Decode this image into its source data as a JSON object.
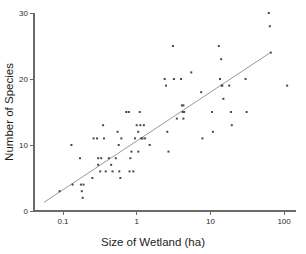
{
  "chart_data": {
    "type": "scatter",
    "title": "",
    "xlabel": "Size of Wetland (ha)",
    "ylabel": "Number of Species",
    "xscale": "log",
    "yscale": "linear",
    "xlim": [
      0.045,
      160
    ],
    "ylim": [
      0,
      31
    ],
    "grid": false,
    "legend": "none",
    "xticks": [
      0.1,
      1,
      10,
      100
    ],
    "xtick_labels": [
      "0.1",
      "1",
      "10",
      "100"
    ],
    "yticks": [
      0,
      10,
      20,
      30
    ],
    "ytick_labels": [
      "0",
      "10",
      "20",
      "30"
    ],
    "marker": "square",
    "marker_color": "#4a4a4a",
    "fit_line": {
      "present": true,
      "color": "#8d8d8d",
      "x_start": 0.055,
      "y_start": 1.3,
      "x_end": 65,
      "y_end": 24.0
    },
    "points": [
      {
        "x": 0.09,
        "y": 3
      },
      {
        "x": 0.13,
        "y": 10
      },
      {
        "x": 0.135,
        "y": 4
      },
      {
        "x": 0.17,
        "y": 8
      },
      {
        "x": 0.175,
        "y": 4
      },
      {
        "x": 0.19,
        "y": 4
      },
      {
        "x": 0.18,
        "y": 3
      },
      {
        "x": 0.185,
        "y": 2
      },
      {
        "x": 0.26,
        "y": 11
      },
      {
        "x": 0.25,
        "y": 5
      },
      {
        "x": 0.3,
        "y": 7
      },
      {
        "x": 0.29,
        "y": 11
      },
      {
        "x": 0.3,
        "y": 8
      },
      {
        "x": 0.33,
        "y": 8
      },
      {
        "x": 0.32,
        "y": 6
      },
      {
        "x": 0.35,
        "y": 13
      },
      {
        "x": 0.36,
        "y": 11
      },
      {
        "x": 0.38,
        "y": 6
      },
      {
        "x": 0.42,
        "y": 8
      },
      {
        "x": 0.45,
        "y": 7
      },
      {
        "x": 0.47,
        "y": 6
      },
      {
        "x": 0.52,
        "y": 8
      },
      {
        "x": 0.55,
        "y": 12
      },
      {
        "x": 0.57,
        "y": 10
      },
      {
        "x": 0.58,
        "y": 6
      },
      {
        "x": 0.6,
        "y": 5
      },
      {
        "x": 0.62,
        "y": 11
      },
      {
        "x": 0.72,
        "y": 15
      },
      {
        "x": 0.78,
        "y": 15
      },
      {
        "x": 0.8,
        "y": 6
      },
      {
        "x": 0.82,
        "y": 8
      },
      {
        "x": 0.85,
        "y": 9
      },
      {
        "x": 0.9,
        "y": 6
      },
      {
        "x": 0.95,
        "y": 11
      },
      {
        "x": 1.0,
        "y": 13
      },
      {
        "x": 1.05,
        "y": 12
      },
      {
        "x": 1.05,
        "y": 9
      },
      {
        "x": 1.1,
        "y": 15
      },
      {
        "x": 1.12,
        "y": 13
      },
      {
        "x": 1.15,
        "y": 11
      },
      {
        "x": 1.2,
        "y": 11
      },
      {
        "x": 1.25,
        "y": 13
      },
      {
        "x": 1.3,
        "y": 11
      },
      {
        "x": 1.5,
        "y": 10
      },
      {
        "x": 2.4,
        "y": 20
      },
      {
        "x": 2.5,
        "y": 19
      },
      {
        "x": 2.6,
        "y": 12
      },
      {
        "x": 2.7,
        "y": 9
      },
      {
        "x": 3.1,
        "y": 25
      },
      {
        "x": 3.2,
        "y": 20
      },
      {
        "x": 3.5,
        "y": 14
      },
      {
        "x": 4.0,
        "y": 20
      },
      {
        "x": 4.1,
        "y": 16
      },
      {
        "x": 4.3,
        "y": 16
      },
      {
        "x": 4.2,
        "y": 15
      },
      {
        "x": 4.4,
        "y": 15
      },
      {
        "x": 4.3,
        "y": 14
      },
      {
        "x": 5.5,
        "y": 21
      },
      {
        "x": 7.5,
        "y": 18
      },
      {
        "x": 7.8,
        "y": 11
      },
      {
        "x": 10.5,
        "y": 15
      },
      {
        "x": 10.8,
        "y": 12
      },
      {
        "x": 13.0,
        "y": 25
      },
      {
        "x": 13.5,
        "y": 20
      },
      {
        "x": 14.0,
        "y": 23
      },
      {
        "x": 14.5,
        "y": 19
      },
      {
        "x": 14.2,
        "y": 19
      },
      {
        "x": 15.0,
        "y": 17
      },
      {
        "x": 18.0,
        "y": 19
      },
      {
        "x": 19.0,
        "y": 15
      },
      {
        "x": 19.5,
        "y": 13
      },
      {
        "x": 30.0,
        "y": 20
      },
      {
        "x": 31.0,
        "y": 15
      },
      {
        "x": 62.0,
        "y": 30
      },
      {
        "x": 64.0,
        "y": 28
      },
      {
        "x": 66.0,
        "y": 24
      },
      {
        "x": 110.0,
        "y": 19
      }
    ]
  },
  "axes": {
    "x_title": "Size of Wetland (ha)",
    "y_title": "Number of Species"
  }
}
